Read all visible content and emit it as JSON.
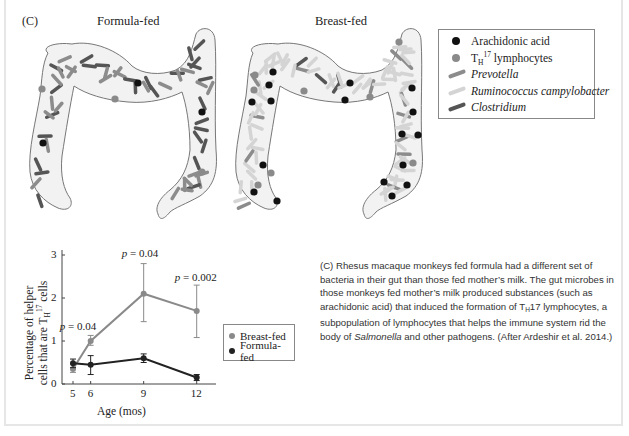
{
  "figure": {
    "panel_label": "(C)",
    "left_title": "Formula-fed",
    "right_title": "Breast-fed",
    "legend": {
      "items": [
        {
          "label": "Arachidonic acid",
          "type": "dot",
          "color": "#111111",
          "italic": false
        },
        {
          "label_main": "T",
          "label_sub": "H",
          "label_sup": "17",
          "label_rest": " lymphocytes",
          "type": "dot",
          "color": "#8a8a8a",
          "italic": false
        },
        {
          "label": "Prevotella",
          "type": "rod",
          "color": "#8c8c8c",
          "italic": true
        },
        {
          "label": "Ruminococcus campylobacter",
          "type": "rod",
          "color": "#d4d4d4",
          "italic": true
        },
        {
          "label": "Clostridium",
          "type": "rod",
          "color": "#555555",
          "italic": true
        }
      ]
    },
    "colors": {
      "colon_fill": "#f2f2f2",
      "colon_stroke": "#777777",
      "arachidonic": "#111111",
      "th17": "#8a8a8a",
      "prevotella": "#8c8c8c",
      "ruminococcus": "#d4d4d4",
      "clostridium": "#555555"
    }
  },
  "chart_data": {
    "type": "line",
    "title": "",
    "xlabel": "Age (mos)",
    "ylabel_line1": "Percentage of helper",
    "ylabel_line2_main": "cells that are T",
    "ylabel_line2_sub": "H",
    "ylabel_line2_sup": "17",
    "ylabel_line2_rest": " cells",
    "ylabel": "Percentage of helper cells that are TH17 cells",
    "x": [
      5,
      6,
      9,
      12
    ],
    "x_ticks": [
      "5",
      "6",
      "9",
      "12"
    ],
    "y_ticks": [
      "0",
      "1",
      "2",
      "3"
    ],
    "ylim": [
      0,
      3.1
    ],
    "xlim": [
      4.4,
      13.2
    ],
    "grid": false,
    "legend_position": "right",
    "series": [
      {
        "name": "Breast-fed",
        "color": "#8a8a8a",
        "values": [
          0.35,
          1.0,
          2.1,
          1.7
        ],
        "err_low": [
          0.27,
          0.9,
          1.45,
          1.08
        ],
        "err_high": [
          0.45,
          1.13,
          2.8,
          2.3
        ]
      },
      {
        "name": "Formula-fed",
        "color": "#222222",
        "values": [
          0.48,
          0.45,
          0.6,
          0.15
        ],
        "err_low": [
          0.38,
          0.22,
          0.5,
          0.08
        ],
        "err_high": [
          0.58,
          0.66,
          0.7,
          0.22
        ]
      }
    ],
    "annotations": [
      {
        "text_p": "p",
        "text_rest": " = 0.04",
        "x": 5.5,
        "y": 1.3
      },
      {
        "text_p": "p",
        "text_rest": " = 0.04",
        "x": 9,
        "y": 3.0
      },
      {
        "text_p": "p",
        "text_rest": " = 0.002",
        "x": 12,
        "y": 2.45
      }
    ]
  },
  "caption": {
    "line_prefix": "(C) Rhesus macaque monkeys fed formula had a different set of bacteria in their gut than those fed mother’s milk. The gut microbes in those monkeys fed mother’s milk produced substances (such as arachidonic acid) that induced the formation of T",
    "sub": "H",
    "mid": "17 lymphocytes, a subpopulation of lymphocytes that helps the immune system rid the body of ",
    "italic": "Salmonella",
    "suffix": " and other pathogens. (After Ardeshir et al. 2014.)"
  }
}
